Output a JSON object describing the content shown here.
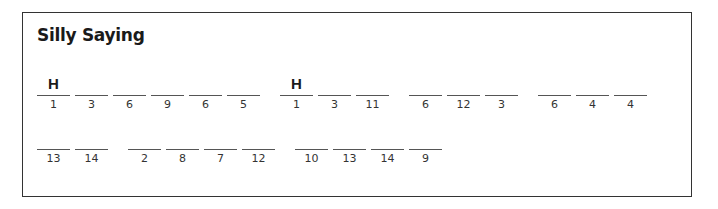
{
  "puzzle": {
    "title": "Silly Saying",
    "rows": [
      {
        "words": [
          [
            {
              "letter": "H",
              "number": "1"
            },
            {
              "letter": "",
              "number": "3"
            },
            {
              "letter": "",
              "number": "6"
            },
            {
              "letter": "",
              "number": "9"
            },
            {
              "letter": "",
              "number": "6"
            },
            {
              "letter": "",
              "number": "5"
            }
          ],
          [
            {
              "letter": "H",
              "number": "1"
            },
            {
              "letter": "",
              "number": "3"
            },
            {
              "letter": "",
              "number": "11"
            }
          ],
          [
            {
              "letter": "",
              "number": "6"
            },
            {
              "letter": "",
              "number": "12"
            },
            {
              "letter": "",
              "number": "3"
            }
          ],
          [
            {
              "letter": "",
              "number": "6"
            },
            {
              "letter": "",
              "number": "4"
            },
            {
              "letter": "",
              "number": "4"
            }
          ]
        ]
      },
      {
        "words": [
          [
            {
              "letter": "",
              "number": "13"
            },
            {
              "letter": "",
              "number": "14"
            }
          ],
          [
            {
              "letter": "",
              "number": "2"
            },
            {
              "letter": "",
              "number": "8"
            },
            {
              "letter": "",
              "number": "7"
            },
            {
              "letter": "",
              "number": "12"
            }
          ],
          [
            {
              "letter": "",
              "number": "10"
            },
            {
              "letter": "",
              "number": "13"
            },
            {
              "letter": "",
              "number": "14"
            },
            {
              "letter": "",
              "number": "9"
            }
          ]
        ]
      }
    ]
  }
}
